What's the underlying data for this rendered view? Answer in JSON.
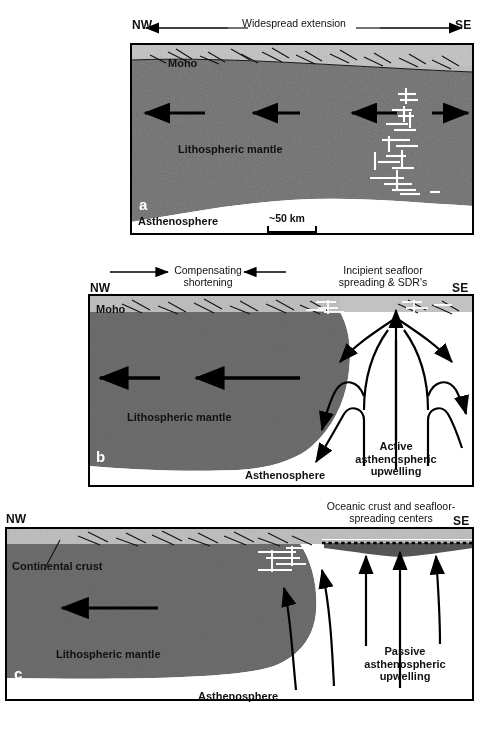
{
  "figure": {
    "type": "geologic-cross-section-series",
    "panels": [
      {
        "letter": "a",
        "top_annotation": "Widespread extension",
        "left_direction": "NW",
        "right_direction": "SE",
        "labels": {
          "moho": "Moho",
          "lithospheric_mantle": "Lithospheric mantle",
          "asthenosphere": "Asthenosphere"
        },
        "scale_bar": "~50 km",
        "arrows": {
          "count": 4,
          "directions": [
            "left",
            "left",
            "left",
            "right"
          ],
          "description": "horizontal extension arrows within lithospheric mantle"
        },
        "dike_swarm": "white vertical dike intrusions near SE margin"
      },
      {
        "letter": "b",
        "left_annotation": "Compensating\nshortening",
        "right_annotation": "Incipient seafloor\nspreading & SDR's",
        "left_direction": "NW",
        "right_direction": "SE",
        "labels": {
          "moho": "Moho",
          "lithospheric_mantle": "Lithospheric mantle",
          "asthenosphere": "Asthenosphere",
          "upwelling": "Active\nasthenospheric\nupwelling"
        },
        "arrows": {
          "shortening_left": "right",
          "shortening_right": "left",
          "mantle_flow": [
            "left",
            "left"
          ],
          "description": "convective upwelling plume with diverging limbs"
        }
      },
      {
        "letter": "c",
        "top_annotation": "Oceanic crust and seafloor-\nspreading centers",
        "left_direction": "NW",
        "right_direction": "SE",
        "labels": {
          "continental_crust": "Continental crust",
          "lithospheric_mantle": "Lithospheric mantle",
          "asthenosphere": "Asthenosphere",
          "upwelling": "Passive\nasthenospheric\nupwelling"
        },
        "arrows": {
          "mantle_flow": [
            "left"
          ],
          "upwelling_count": 4,
          "description": "vertical passive upwelling arrows beneath spreading center"
        }
      }
    ],
    "colors": {
      "crust": "#b9b9b9",
      "lithospheric_mantle": "#6e6e6e",
      "asthenosphere": "#ffffff",
      "outline": "#000000",
      "text": "#111111",
      "dike": "#ffffff"
    }
  }
}
